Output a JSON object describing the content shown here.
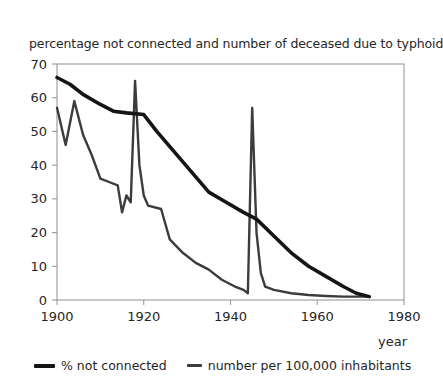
{
  "chart_data": {
    "type": "line",
    "title": "percentage not connected and number of deceased due to typhoid",
    "xlabel": "year",
    "ylabel": "",
    "xlim": [
      1900,
      1980
    ],
    "ylim": [
      0,
      70
    ],
    "xticks": [
      "1900",
      "1920",
      "1940",
      "1960",
      "1980"
    ],
    "yticks": [
      "0",
      "10",
      "20",
      "30",
      "40",
      "50",
      "60",
      "70"
    ],
    "xtick_values": [
      1900,
      1920,
      1940,
      1960,
      1980
    ],
    "ytick_values": [
      0,
      10,
      20,
      30,
      40,
      50,
      60,
      70
    ],
    "grid": false,
    "legend_position": "below",
    "series": [
      {
        "name": "% not connected",
        "color": "#151515",
        "width": 3.6,
        "points": [
          [
            1900,
            66
          ],
          [
            1903,
            64
          ],
          [
            1906,
            61
          ],
          [
            1910,
            58
          ],
          [
            1913,
            56
          ],
          [
            1916,
            55.5
          ],
          [
            1920,
            55
          ],
          [
            1923,
            50
          ],
          [
            1927,
            44
          ],
          [
            1931,
            38
          ],
          [
            1935,
            32
          ],
          [
            1939,
            29
          ],
          [
            1943,
            26
          ],
          [
            1946,
            24
          ],
          [
            1950,
            19
          ],
          [
            1954,
            14
          ],
          [
            1958,
            10
          ],
          [
            1962,
            7
          ],
          [
            1966,
            4
          ],
          [
            1969,
            2
          ],
          [
            1972,
            1
          ]
        ]
      },
      {
        "name": "number per 100,000 inhabitants",
        "color": "#3c3c3c",
        "width": 2.4,
        "points": [
          [
            1900,
            57
          ],
          [
            1902,
            46
          ],
          [
            1904,
            59
          ],
          [
            1906,
            49
          ],
          [
            1908,
            43
          ],
          [
            1910,
            36
          ],
          [
            1912,
            35
          ],
          [
            1914,
            34
          ],
          [
            1915,
            26
          ],
          [
            1916,
            31
          ],
          [
            1917,
            29
          ],
          [
            1918,
            65
          ],
          [
            1919,
            40
          ],
          [
            1920,
            31
          ],
          [
            1921,
            28
          ],
          [
            1924,
            27
          ],
          [
            1926,
            18
          ],
          [
            1929,
            14
          ],
          [
            1932,
            11
          ],
          [
            1935,
            9
          ],
          [
            1938,
            6
          ],
          [
            1941,
            4
          ],
          [
            1943,
            3
          ],
          [
            1944,
            2
          ],
          [
            1945,
            57
          ],
          [
            1946,
            20
          ],
          [
            1947,
            8
          ],
          [
            1948,
            4
          ],
          [
            1950,
            3
          ],
          [
            1954,
            2
          ],
          [
            1958,
            1.5
          ],
          [
            1962,
            1.2
          ],
          [
            1966,
            1
          ],
          [
            1969,
            1
          ],
          [
            1972,
            1
          ]
        ]
      }
    ]
  },
  "legend": {
    "items": [
      {
        "label": "% not connected"
      },
      {
        "label": "number per 100,000 inhabitants"
      }
    ]
  }
}
